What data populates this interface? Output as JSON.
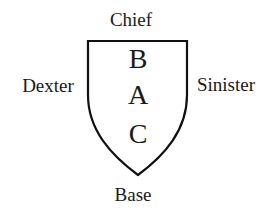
{
  "diagram": {
    "type": "heraldic-shield-orientation",
    "outer_labels": {
      "top": "Chief",
      "left": "Dexter",
      "right": "Sinister",
      "bottom": "Base"
    },
    "inner_points": [
      {
        "id": "B",
        "label": "B"
      },
      {
        "id": "A",
        "label": "A"
      },
      {
        "id": "C",
        "label": "C"
      }
    ],
    "colors": {
      "stroke": "#111111",
      "text": "#1a1a1a",
      "background": "#ffffff",
      "shield_fill": "#ffffff"
    }
  }
}
